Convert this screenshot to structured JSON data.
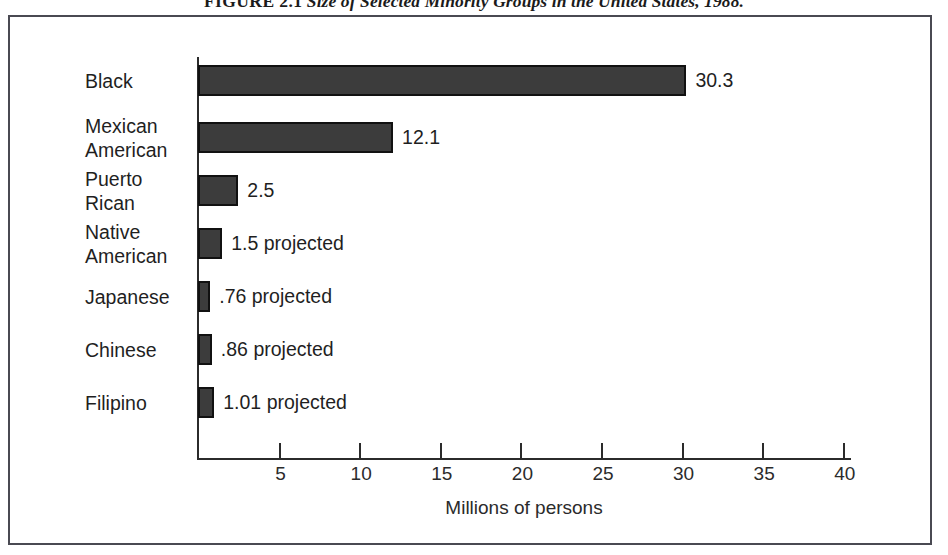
{
  "figure": {
    "caption_number": "FIGURE 2.1",
    "caption_text": "Size of Selected Minority Groups in the United States, 1988."
  },
  "chart_data": {
    "type": "bar",
    "orientation": "horizontal",
    "title": "Size of Selected Minority Groups in the United States, 1988.",
    "xlabel": "Millions of persons",
    "ylabel": "",
    "xlim": [
      0,
      40.5
    ],
    "xticks": [
      5,
      10,
      15,
      20,
      25,
      30,
      35,
      40
    ],
    "xtick_labels": [
      "5",
      "10",
      "15",
      "20",
      "25",
      "30",
      "35",
      "40"
    ],
    "grid": false,
    "legend": false,
    "categories": [
      "Black",
      "Mexican American",
      "Puerto Rican",
      "Native American",
      "Japanese",
      "Chinese",
      "Filipino"
    ],
    "values": [
      30.3,
      12.1,
      2.5,
      1.5,
      0.76,
      0.86,
      1.01
    ],
    "data_labels": [
      "30.3",
      "12.1",
      "2.5",
      "1.5 projected",
      ".76 projected",
      ".86 projected",
      "1.01 projected"
    ],
    "bar_color": "#3c3c3c",
    "bar_edge_color": "#111111"
  },
  "bars": [
    {
      "label": "Black",
      "label_lines": "Black",
      "value": 30.3,
      "value_label": "30.3"
    },
    {
      "label": "Mexican American",
      "label_lines": "Mexican\nAmerican",
      "value": 12.1,
      "value_label": "12.1"
    },
    {
      "label": "Puerto Rican",
      "label_lines": "Puerto\nRican",
      "value": 2.5,
      "value_label": "2.5"
    },
    {
      "label": "Native American",
      "label_lines": "Native\nAmerican",
      "value": 1.5,
      "value_label": "1.5 projected"
    },
    {
      "label": "Japanese",
      "label_lines": "Japanese",
      "value": 0.76,
      "value_label": ".76 projected"
    },
    {
      "label": "Chinese",
      "label_lines": "Chinese",
      "value": 0.86,
      "value_label": ".86 projected"
    },
    {
      "label": "Filipino",
      "label_lines": "Filipino",
      "value": 1.01,
      "value_label": "1.01 projected"
    }
  ],
  "axis": {
    "x_title": "Millions of persons",
    "ticks": [
      "5",
      "10",
      "15",
      "20",
      "25",
      "30",
      "35",
      "40"
    ]
  },
  "colors": {
    "bar_fill": "#3c3c3c",
    "bar_edge": "#111111",
    "frame_border": "#4a4a52",
    "axis": "#2b2b2b",
    "text": "#1f1f1f",
    "background": "#ffffff"
  }
}
